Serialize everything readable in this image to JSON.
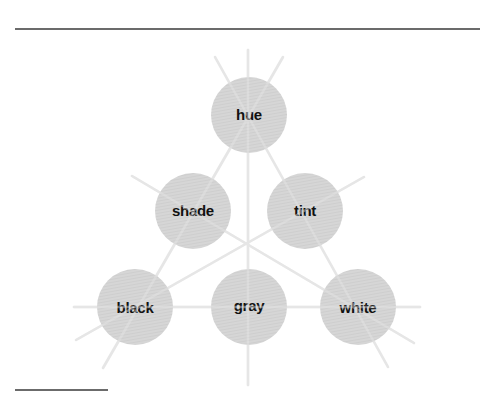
{
  "diagram": {
    "title": "",
    "colors": {
      "circle_fill": "#d4d4d4",
      "circle_hatch": "#c4c4c4",
      "ray": "#e6e6e6",
      "label": "#111111",
      "rule": "#6b6b6b"
    },
    "nodes": [
      {
        "id": "hue",
        "label": "hue",
        "cx": 249,
        "cy": 115,
        "r": 38
      },
      {
        "id": "shade",
        "label": "shade",
        "cx": 193,
        "cy": 211,
        "r": 38
      },
      {
        "id": "tint",
        "label": "tint",
        "cx": 305,
        "cy": 211,
        "r": 38
      },
      {
        "id": "black",
        "label": "black",
        "cx": 135,
        "cy": 307,
        "r": 38
      },
      {
        "id": "gray",
        "label": "gray",
        "cx": 249,
        "cy": 307,
        "r": 38
      },
      {
        "id": "white",
        "label": "white",
        "cx": 358,
        "cy": 307,
        "r": 38
      }
    ],
    "edges": [
      {
        "from": "hue",
        "to": "white",
        "via": "tint"
      },
      {
        "from": "hue",
        "to": "black",
        "via": "shade"
      },
      {
        "from": "hue",
        "to": "gray"
      },
      {
        "from": "shade",
        "to": "white"
      },
      {
        "from": "tint",
        "to": "black"
      },
      {
        "from": "black",
        "to": "white",
        "via": "gray"
      }
    ]
  }
}
